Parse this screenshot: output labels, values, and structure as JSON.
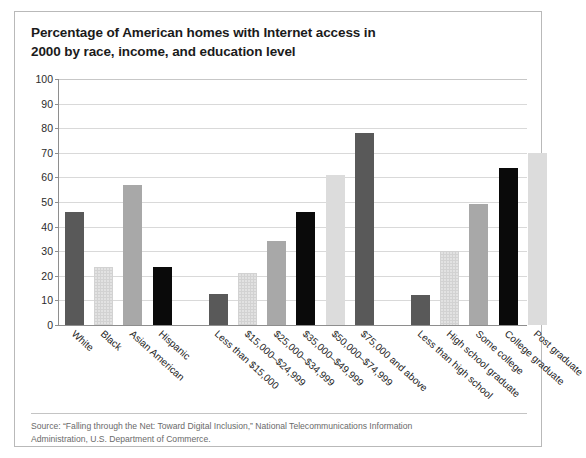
{
  "title": {
    "line1": "Percentage of American homes with Internet access in",
    "line2": "2000 by race, income, and education level"
  },
  "source": {
    "line1": "Source: “Falling through the Net: Toward Digital Inclusion,” National Telecommunications Information",
    "line2": "Administration, U.S. Department of Commerce."
  },
  "axis": {
    "yticks": [
      "0",
      "10",
      "20",
      "30",
      "40",
      "50",
      "60",
      "70",
      "80",
      "90",
      "100"
    ]
  },
  "colors": {
    "dark_gray": "#595959",
    "dotted_light": "#e2e2e2",
    "mid_gray": "#a8a8a8",
    "black": "#0a0a0a",
    "light_gray": "#dcdcdc",
    "gridline": "#d9d9d9",
    "axis": "#8e8e8e",
    "frame": "#b9b9b9",
    "title_text": "#1b1b1b",
    "source_text": "#6a6a6a"
  },
  "chart_data": {
    "type": "bar",
    "title": "Percentage of American homes with Internet access in 2000 by race, income, and education level",
    "xlabel": "",
    "ylabel": "",
    "ylim": [
      0,
      100
    ],
    "ytick_step": 10,
    "grid": true,
    "legend": "none",
    "groups": [
      {
        "name": "Race",
        "categories": [
          "White",
          "Black",
          "Asian American",
          "Hispanic"
        ],
        "values": [
          46,
          23.5,
          57,
          23.5
        ],
        "fills": [
          "dark_gray",
          "dotted_light",
          "mid_gray",
          "black"
        ]
      },
      {
        "name": "Household income",
        "categories": [
          "Less than $15,000",
          "$15,000–$24,999",
          "$25,000–$34,999",
          "$35,000–$49,999",
          "$50,000–$74,999",
          "$75,000 and above"
        ],
        "values": [
          12.7,
          21,
          34,
          46,
          61,
          78
        ],
        "fills": [
          "dark_gray",
          "dotted_light",
          "mid_gray",
          "black",
          "light_gray",
          "dark_gray"
        ]
      },
      {
        "name": "Education level",
        "categories": [
          "Less than high school",
          "High school graduate",
          "Some college",
          "College graduate",
          "Post graduate"
        ],
        "values": [
          12.3,
          30,
          49,
          64,
          70
        ],
        "fills": [
          "dark_gray",
          "dotted_light",
          "mid_gray",
          "black",
          "light_gray"
        ]
      }
    ]
  }
}
